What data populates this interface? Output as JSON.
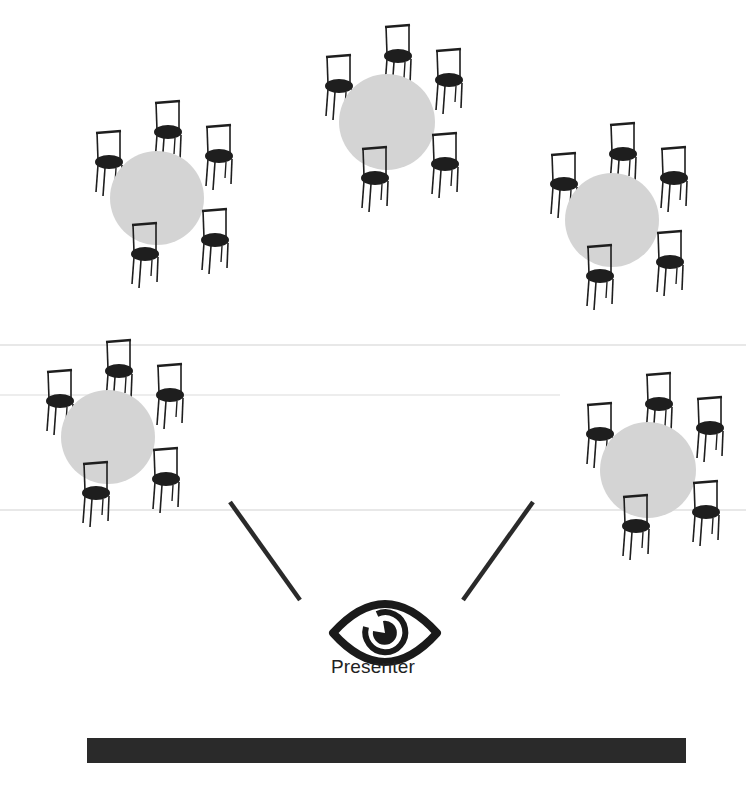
{
  "diagram": {
    "colors": {
      "background": "#ffffff",
      "table_fill": "#d4d4d4",
      "chair_dark": "#1e1e1e",
      "line_dark": "#2a2a2a",
      "faint_rule": "#e6e6e6",
      "whiteboard": "#2a2a2a"
    },
    "tables": [
      {
        "id": "table-1",
        "cx": 157,
        "cy": 198,
        "r": 47,
        "chairs": 6
      },
      {
        "id": "table-2",
        "cx": 387,
        "cy": 122,
        "r": 48,
        "chairs": 6
      },
      {
        "id": "table-3",
        "cx": 612,
        "cy": 220,
        "r": 47,
        "chairs": 6
      },
      {
        "id": "table-4",
        "cx": 108,
        "cy": 437,
        "r": 47,
        "chairs": 6
      },
      {
        "id": "table-5",
        "cx": 648,
        "cy": 470,
        "r": 48,
        "chairs": 6
      }
    ],
    "sightlines": [
      {
        "id": "left-sightline",
        "x1": 230,
        "y1": 502,
        "x2": 300,
        "y2": 600
      },
      {
        "id": "right-sightline",
        "x1": 533,
        "y1": 502,
        "x2": 463,
        "y2": 600
      }
    ],
    "presenter": {
      "icon": "eye-icon",
      "label": "Presenter",
      "cx": 385,
      "cy": 633
    },
    "whiteboard": {
      "icon": "whiteboard-bar"
    }
  }
}
